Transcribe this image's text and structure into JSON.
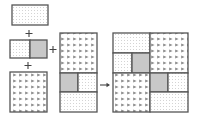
{
  "diagram": {
    "colors": {
      "stroke": "#555555",
      "gray_fill": "#c8c8c8",
      "dot_color": "#b0b0b0",
      "triangle_color": "#8a8a8a",
      "background": "#ffffff"
    },
    "operators": {
      "plus": "+",
      "arrow": "→"
    },
    "pieces": [
      {
        "id": "top-rect",
        "pattern": "dotted"
      },
      {
        "id": "split-rect",
        "patterns": [
          "dotted",
          "gray"
        ]
      },
      {
        "id": "triangle-square",
        "pattern": "triangles"
      },
      {
        "id": "middle-composite",
        "patterns": [
          "triangles",
          "gray",
          "dotted",
          "dotted"
        ]
      }
    ],
    "result": {
      "id": "final-composite",
      "patterns": [
        "dotted",
        "dotted",
        "gray",
        "triangles",
        "triangles",
        "gray",
        "dotted",
        "dotted"
      ]
    }
  }
}
